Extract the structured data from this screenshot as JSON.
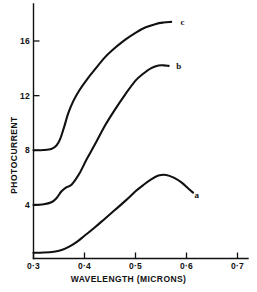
{
  "chart_data": {
    "type": "line",
    "title": "",
    "xlabel": "WAVELENGTH (MICRONS)",
    "ylabel": "PHOTOCURRENT",
    "xlim": [
      0.3,
      0.7
    ],
    "ylim": [
      0.0,
      18.5
    ],
    "grid": false,
    "legend": "inline-curve-labels",
    "xticks": [
      0.3,
      0.4,
      0.5,
      0.6,
      0.7
    ],
    "xtick_labels": [
      "0·3",
      "0·4",
      "0·5",
      "0·6",
      "0·7"
    ],
    "yticks": [
      4,
      8,
      12,
      16
    ],
    "ytick_labels": [
      "4",
      "8",
      "12",
      "16"
    ],
    "series": [
      {
        "name": "a",
        "label": "a",
        "label_x": 0.62,
        "label_y": 4.7,
        "x": [
          0.3,
          0.32,
          0.34,
          0.355,
          0.37,
          0.385,
          0.4,
          0.42,
          0.44,
          0.46,
          0.48,
          0.5,
          0.515,
          0.53,
          0.545,
          0.56,
          0.575,
          0.59,
          0.605,
          0.613
        ],
        "y": [
          0.5,
          0.52,
          0.58,
          0.7,
          0.95,
          1.3,
          1.75,
          2.35,
          3.0,
          3.65,
          4.3,
          5.0,
          5.45,
          5.85,
          6.15,
          6.2,
          6.0,
          5.65,
          5.15,
          4.9
        ]
      },
      {
        "name": "b",
        "label": "b",
        "label_x": 0.585,
        "label_y": 14.2,
        "x": [
          0.3,
          0.32,
          0.335,
          0.345,
          0.355,
          0.365,
          0.375,
          0.39,
          0.405,
          0.42,
          0.44,
          0.46,
          0.48,
          0.5,
          0.515,
          0.53,
          0.545,
          0.555,
          0.565
        ],
        "y": [
          4.0,
          4.05,
          4.2,
          4.5,
          5.0,
          5.3,
          5.5,
          6.3,
          7.4,
          8.4,
          9.8,
          11.0,
          12.1,
          13.1,
          13.6,
          14.0,
          14.2,
          14.22,
          14.18
        ]
      },
      {
        "name": "c",
        "label": "c",
        "label_x": 0.592,
        "label_y": 17.4,
        "x": [
          0.3,
          0.32,
          0.335,
          0.345,
          0.352,
          0.36,
          0.368,
          0.378,
          0.39,
          0.405,
          0.42,
          0.44,
          0.46,
          0.48,
          0.5,
          0.52,
          0.54,
          0.555,
          0.57
        ],
        "y": [
          8.0,
          8.02,
          8.1,
          8.35,
          8.8,
          9.7,
          10.7,
          11.6,
          12.4,
          13.2,
          13.9,
          14.8,
          15.5,
          16.1,
          16.6,
          17.0,
          17.25,
          17.35,
          17.4
        ]
      }
    ]
  }
}
